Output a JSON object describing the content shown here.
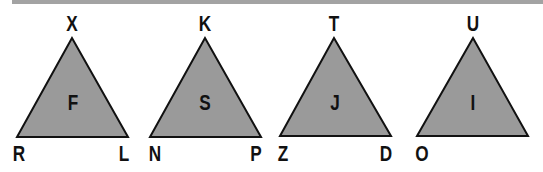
{
  "diagram": {
    "fill_color": "#9a9a9a",
    "stroke_color": "#111111",
    "triangles": [
      {
        "center": "F",
        "top": "X",
        "bottom_left": "R",
        "bottom_right": "L"
      },
      {
        "center": "S",
        "top": "K",
        "bottom_left": "N",
        "bottom_right": "P"
      },
      {
        "center": "J",
        "top": "T",
        "bottom_left": "Z",
        "bottom_right": "D"
      },
      {
        "center": "I",
        "top": "U",
        "bottom_left": "O",
        "bottom_right": ""
      }
    ]
  }
}
